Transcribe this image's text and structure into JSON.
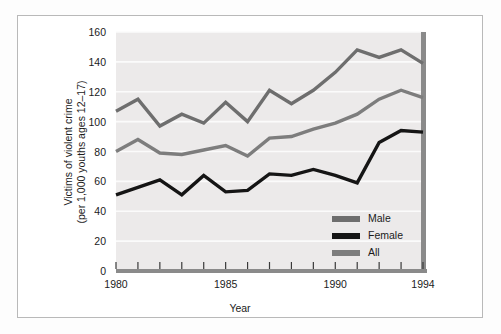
{
  "chart_data": {
    "type": "line",
    "title": "",
    "xlabel": "Year",
    "ylabel": "Victims of violent crime\n(per 1,000 youths ages 12–17)",
    "ylabel_line1": "Victims of violent crime",
    "ylabel_line2": "(per 1,000 youths ages 12–17)",
    "x": [
      1980,
      1981,
      1982,
      1983,
      1984,
      1985,
      1986,
      1987,
      1988,
      1989,
      1990,
      1991,
      1992,
      1993,
      1994
    ],
    "categories": [
      "1980",
      "1981",
      "1982",
      "1983",
      "1984",
      "1985",
      "1986",
      "1987",
      "1988",
      "1989",
      "1990",
      "1991",
      "1992",
      "1993",
      "1994"
    ],
    "xlim": [
      1980,
      1994
    ],
    "ylim": [
      0,
      160
    ],
    "yticks": [
      0,
      20,
      40,
      60,
      80,
      100,
      120,
      140,
      160
    ],
    "ytick_labels": [
      "0",
      "20",
      "40",
      "60",
      "80",
      "100",
      "120",
      "140",
      "160"
    ],
    "xticks": [
      1980,
      1981,
      1982,
      1983,
      1984,
      1985,
      1986,
      1987,
      1988,
      1989,
      1990,
      1991,
      1992,
      1993,
      1994
    ],
    "xtick_labels_shown": [
      "1980",
      "1985",
      "1990",
      "1994"
    ],
    "grid": true,
    "grid_axis": "y",
    "legend_position": "lower-right",
    "series": [
      {
        "name": "Male",
        "color": "#6e6e6e",
        "values": [
          107,
          115,
          97,
          105,
          99,
          113,
          100,
          121,
          112,
          121,
          133,
          148,
          143,
          148,
          139
        ]
      },
      {
        "name": "Female",
        "color": "#151515",
        "values": [
          51,
          56,
          61,
          51,
          64,
          53,
          54,
          65,
          64,
          68,
          64,
          59,
          86,
          94,
          93
        ]
      },
      {
        "name": "All",
        "color": "#7d7d7d",
        "values": [
          80,
          88,
          79,
          78,
          81,
          84,
          77,
          89,
          90,
          95,
          99,
          105,
          115,
          121,
          116
        ]
      }
    ]
  },
  "legend": {
    "items": [
      {
        "label": "Male",
        "color": "#6e6e6e"
      },
      {
        "label": "Female",
        "color": "#151515"
      },
      {
        "label": "All",
        "color": "#7d7d7d"
      }
    ]
  },
  "axes": {
    "x_axis_title": "Year",
    "y_axis_title_line1": "Victims of violent crime",
    "y_axis_title_line2": "(per 1,000 youths ages 12–17)"
  },
  "colors": {
    "plot_background": "#eceaea",
    "gridline": "#fbfbfb",
    "axis": "#8a8a8a",
    "frame_border": "#b9b9b9",
    "page_background": "#ffffff",
    "male": "#6e6e6e",
    "female": "#151515",
    "all": "#7d7d7d"
  }
}
